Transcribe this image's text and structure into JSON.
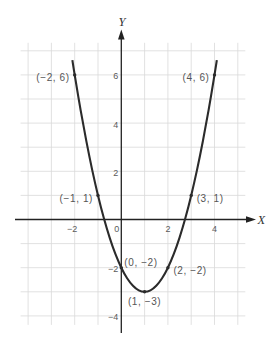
{
  "colors": {
    "background": "#ffffff",
    "grid": "#d9d9d9",
    "axis": "#222222",
    "curve": "#2b2b2b",
    "text": "#555555"
  },
  "chart_data": {
    "type": "line",
    "title": "",
    "xlabel": "X",
    "ylabel": "Y",
    "xlim": [
      -4,
      5
    ],
    "ylim": [
      -4,
      7
    ],
    "grid": true,
    "legend": "none",
    "x_ticks": [
      {
        "value": -2,
        "label": "−2"
      },
      {
        "value": 0,
        "label": "0"
      },
      {
        "value": 2,
        "label": "2"
      },
      {
        "value": 4,
        "label": "4"
      }
    ],
    "y_ticks": [
      {
        "value": 6,
        "label": "6"
      },
      {
        "value": 4,
        "label": "4"
      },
      {
        "value": 2,
        "label": "2"
      },
      {
        "value": -2,
        "label": "−2"
      },
      {
        "value": -4,
        "label": "−4"
      }
    ],
    "series": [
      {
        "name": "parabola",
        "x": [
          -2.1,
          -2,
          -1.75,
          -1.5,
          -1.25,
          -1,
          -0.75,
          -0.5,
          -0.25,
          0,
          0.25,
          0.5,
          0.75,
          1,
          1.25,
          1.5,
          1.75,
          2,
          2.25,
          2.5,
          2.75,
          3,
          3.25,
          3.5,
          3.75,
          4,
          4.1
        ],
        "y": [
          6.61,
          6,
          4.56,
          3.25,
          2.06,
          1,
          0.06,
          -0.75,
          -1.44,
          -2,
          -2.44,
          -2.75,
          -2.94,
          -3,
          -2.94,
          -2.75,
          -2.44,
          -2,
          -1.44,
          -0.75,
          0.06,
          1,
          2.06,
          3.25,
          4.56,
          6,
          6.61
        ]
      }
    ],
    "labeled_points": [
      {
        "x": -2,
        "y": 6,
        "label": "(−2, 6)",
        "position": "left"
      },
      {
        "x": 4,
        "y": 6,
        "label": "(4, 6)",
        "position": "left"
      },
      {
        "x": -1,
        "y": 1,
        "label": "(−1, 1)",
        "position": "left"
      },
      {
        "x": 3,
        "y": 1,
        "label": "(3, 1)",
        "position": "right"
      },
      {
        "x": 0,
        "y": -2,
        "label": "(0, −2)",
        "position": "above-right"
      },
      {
        "x": 2,
        "y": -2,
        "label": "(2, −2)",
        "position": "right"
      },
      {
        "x": 1,
        "y": -3,
        "label": "(1, −3)",
        "position": "below"
      }
    ]
  }
}
